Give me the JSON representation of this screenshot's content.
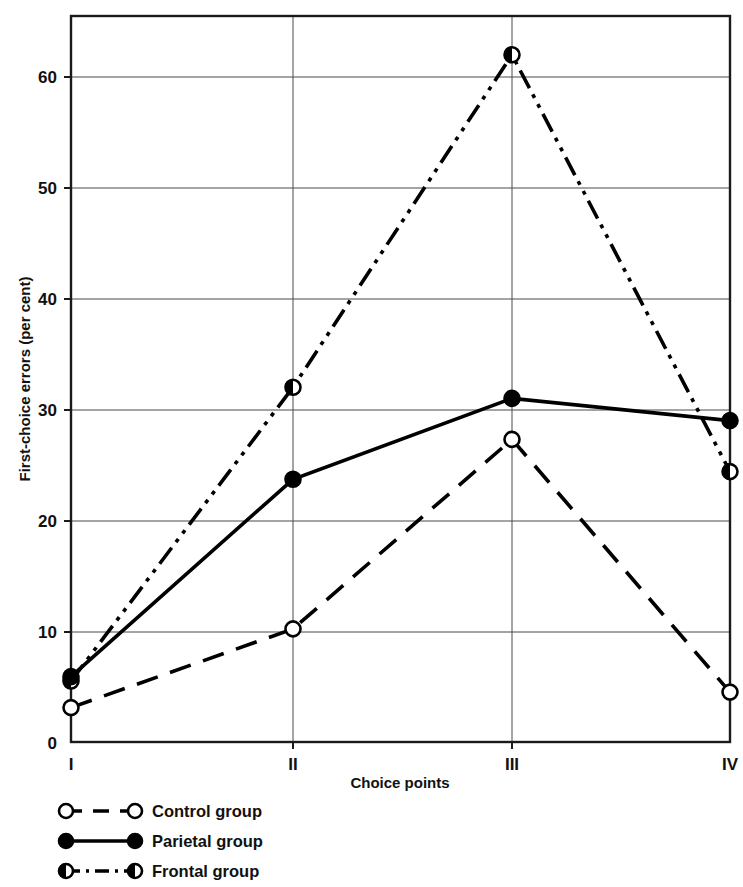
{
  "chart_data": {
    "type": "line",
    "title": "",
    "xlabel": "Choice points",
    "ylabel": "First-choice errors (per cent)",
    "categories": [
      "I",
      "II",
      "III",
      "IV"
    ],
    "x": [
      1,
      2,
      3,
      4
    ],
    "ylim": [
      0,
      65
    ],
    "yticks": [
      0,
      10,
      20,
      30,
      40,
      50,
      60
    ],
    "ytick_labels": [
      "0",
      "10",
      "20",
      "30",
      "40",
      "50",
      "60"
    ],
    "grid": "horizontal-and-vertical",
    "legend_position": "below-axes-left",
    "series": [
      {
        "name": "Control group",
        "values": [
          3.1,
          10.2,
          27.3,
          4.5
        ],
        "marker": "open-circle",
        "linestyle": "dashed",
        "color": "#000000"
      },
      {
        "name": "Parietal group",
        "values": [
          5.9,
          23.7,
          31.0,
          29.0
        ],
        "marker": "filled-circle",
        "linestyle": "solid",
        "color": "#000000"
      },
      {
        "name": "Frontal group",
        "values": [
          5.5,
          32.0,
          62.0,
          24.4
        ],
        "marker": "half-filled-circle",
        "linestyle": "dash-dot-dot",
        "color": "#000000"
      }
    ]
  },
  "axes": {
    "y_title": "First-choice errors (per cent)",
    "x_title": "Choice points",
    "y_tick_0": "0",
    "y_tick_10": "10",
    "y_tick_20": "20",
    "y_tick_30": "30",
    "y_tick_40": "40",
    "y_tick_50": "50",
    "y_tick_60": "60",
    "x_tick_1": "I",
    "x_tick_2": "II",
    "x_tick_3": "III",
    "x_tick_4": "IV"
  },
  "legend": {
    "entry_1": "Control group",
    "entry_2": "Parietal group",
    "entry_3": "Frontal group"
  }
}
